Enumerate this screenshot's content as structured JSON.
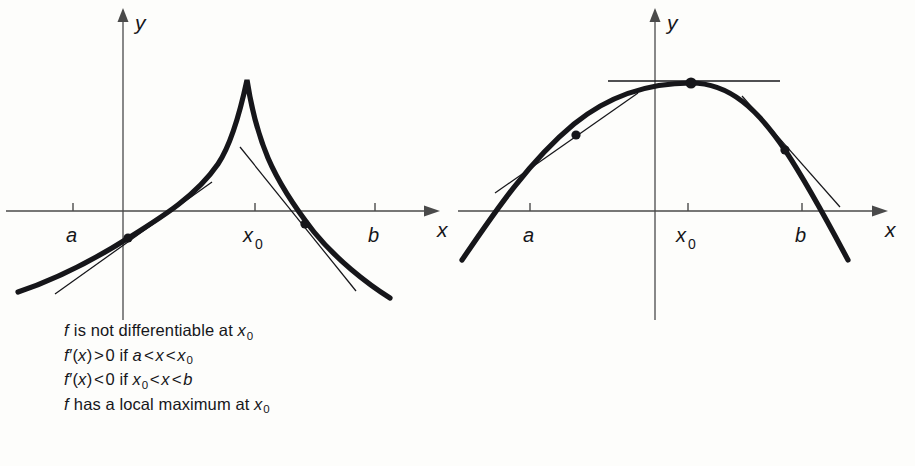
{
  "figure": {
    "background_color": "#fdfdfb",
    "ink_color": "#16161a",
    "axis_color": "#4a4a4a"
  },
  "panels": [
    {
      "id": "left",
      "curve_kind": "cusp",
      "axis_labels": {
        "x": "x",
        "y": "y"
      },
      "tick_labels": [
        {
          "name": "a",
          "text": "a",
          "x": 73
        },
        {
          "name": "x0",
          "text": "x",
          "sub": "0",
          "x": 255
        },
        {
          "name": "b",
          "text": "b",
          "x": 375
        }
      ],
      "caption_lines": [
        {
          "id": "line1",
          "segments": [
            {
              "t": "f",
              "style": "italic"
            },
            {
              "t": " is not differentiable at ",
              "style": "roman"
            },
            {
              "t": "x",
              "style": "italic"
            },
            {
              "t": "0",
              "style": "sub"
            }
          ]
        },
        {
          "id": "line2",
          "segments": [
            {
              "t": "f",
              "style": "italic"
            },
            {
              "t": "′(",
              "style": "roman"
            },
            {
              "t": "x",
              "style": "italic"
            },
            {
              "t": ")",
              "style": "roman"
            },
            {
              "t": ">",
              "style": "rel"
            },
            {
              "t": "0 if ",
              "style": "roman"
            },
            {
              "t": "a",
              "style": "italic"
            },
            {
              "t": "<",
              "style": "rel"
            },
            {
              "t": "x",
              "style": "italic"
            },
            {
              "t": "<",
              "style": "rel"
            },
            {
              "t": "x",
              "style": "italic"
            },
            {
              "t": "0",
              "style": "sub"
            }
          ]
        },
        {
          "id": "line3",
          "segments": [
            {
              "t": "f",
              "style": "italic"
            },
            {
              "t": "′(",
              "style": "roman"
            },
            {
              "t": "x",
              "style": "italic"
            },
            {
              "t": ")",
              "style": "roman"
            },
            {
              "t": "<",
              "style": "rel"
            },
            {
              "t": "0 if ",
              "style": "roman"
            },
            {
              "t": "x",
              "style": "italic"
            },
            {
              "t": "0",
              "style": "sub"
            },
            {
              "t": "<",
              "style": "rel"
            },
            {
              "t": "x",
              "style": "italic"
            },
            {
              "t": "<",
              "style": "rel"
            },
            {
              "t": "b",
              "style": "italic"
            }
          ]
        },
        {
          "id": "line4",
          "segments": [
            {
              "t": "f",
              "style": "italic"
            },
            {
              "t": " has a local maximum at ",
              "style": "roman"
            },
            {
              "t": "x",
              "style": "italic"
            },
            {
              "t": "0",
              "style": "sub"
            }
          ]
        }
      ]
    },
    {
      "id": "right",
      "curve_kind": "smooth-parabola",
      "axis_labels": {
        "x": "x",
        "y": "y"
      },
      "tick_labels": [
        {
          "name": "a",
          "text": "a",
          "x": 530
        },
        {
          "name": "x0",
          "text": "x",
          "sub": "0",
          "x": 688
        },
        {
          "name": "b",
          "text": "b",
          "x": 802
        }
      ],
      "caption_lines": [
        {
          "id": "line1",
          "segments": [
            {
              "t": "f",
              "style": "italic"
            },
            {
              "t": "′(",
              "style": "roman"
            },
            {
              "t": "x",
              "style": "italic"
            },
            {
              "t": "0",
              "style": "sub"
            },
            {
              "t": ") = 0",
              "style": "roman"
            }
          ]
        },
        {
          "id": "line2",
          "segments": [
            {
              "t": "f",
              "style": "italic"
            },
            {
              "t": "′(",
              "style": "roman"
            },
            {
              "t": "x",
              "style": "italic"
            },
            {
              "t": ")",
              "style": "roman"
            },
            {
              "t": ">",
              "style": "rel"
            },
            {
              "t": "0 if ",
              "style": "roman"
            },
            {
              "t": "a",
              "style": "italic"
            },
            {
              "t": "<",
              "style": "rel"
            },
            {
              "t": "x",
              "style": "italic"
            },
            {
              "t": "<",
              "style": "rel"
            },
            {
              "t": "x",
              "style": "italic"
            },
            {
              "t": "0",
              "style": "sub"
            }
          ]
        },
        {
          "id": "line3",
          "segments": [
            {
              "t": "f",
              "style": "italic"
            },
            {
              "t": "′(",
              "style": "roman"
            },
            {
              "t": "x",
              "style": "italic"
            },
            {
              "t": ")",
              "style": "roman"
            },
            {
              "t": "<",
              "style": "rel"
            },
            {
              "t": "0 if ",
              "style": "roman"
            },
            {
              "t": "x",
              "style": "italic"
            },
            {
              "t": "0",
              "style": "sub"
            },
            {
              "t": "<",
              "style": "rel"
            },
            {
              "t": "x",
              "style": "italic"
            },
            {
              "t": "<",
              "style": "rel"
            },
            {
              "t": "b",
              "style": "italic"
            }
          ]
        },
        {
          "id": "line4",
          "segments": [
            {
              "t": "f",
              "style": "italic"
            },
            {
              "t": " has a local maximum at ",
              "style": "roman"
            },
            {
              "t": "x",
              "style": "italic"
            },
            {
              "t": "0",
              "style": "sub"
            }
          ]
        }
      ]
    }
  ],
  "chart_data": [
    {
      "type": "line",
      "name": "left-cusp-graph",
      "title": "",
      "xlabel": "x",
      "ylabel": "y",
      "grid": false,
      "legend": "none",
      "description": "Curve rising from lower left to a sharp cusp at x0, then falling to lower right; not differentiable at x0.",
      "axes": {
        "x_axis_y": 211,
        "y_axis_x": 123,
        "x_axis_x_start": 6,
        "x_axis_x_end": 432,
        "y_axis_y_top": 12,
        "y_axis_y_bottom": 330
      },
      "ticks": [
        {
          "label": "a",
          "x": 73
        },
        {
          "label": "x0",
          "x": 255
        },
        {
          "label": "b",
          "x": 375
        }
      ],
      "curve_points": [
        [
          18,
          292
        ],
        [
          46,
          280
        ],
        [
          78,
          266
        ],
        [
          110,
          248
        ],
        [
          128,
          238
        ],
        [
          152,
          226
        ],
        [
          178,
          210
        ],
        [
          205,
          186
        ],
        [
          228,
          144
        ],
        [
          243,
          96
        ],
        [
          247,
          80
        ],
        [
          252,
          104
        ],
        [
          262,
          144
        ],
        [
          276,
          180
        ],
        [
          290,
          205
        ],
        [
          305,
          224
        ],
        [
          325,
          248
        ],
        [
          352,
          272
        ],
        [
          390,
          298
        ]
      ],
      "tangents": [
        {
          "name": "tangent-left",
          "at_point": [
            128,
            238
          ],
          "x1": 55,
          "y1": 294,
          "x2": 210,
          "y2": 183
        },
        {
          "name": "tangent-right",
          "at_point": [
            305,
            224
          ],
          "x1": 240,
          "y1": 148,
          "x2": 355,
          "y2": 290
        }
      ],
      "marked_points": [
        [
          128,
          238
        ],
        [
          305,
          224
        ]
      ]
    },
    {
      "type": "line",
      "name": "right-parabola-graph",
      "title": "",
      "xlabel": "x",
      "ylabel": "y",
      "grid": false,
      "legend": "none",
      "description": "Smooth concave-down curve with a horizontal tangent at its maximum at x0; derivative is zero there.",
      "axes": {
        "x_axis_y": 211,
        "y_axis_x": 655,
        "x_axis_x_start": 458,
        "x_axis_x_end": 890,
        "y_axis_y_top": 12,
        "y_axis_y_bottom": 330
      },
      "ticks": [
        {
          "label": "a",
          "x": 530
        },
        {
          "label": "x0",
          "x": 688
        },
        {
          "label": "b",
          "x": 802
        }
      ],
      "curve_points": [
        [
          462,
          260
        ],
        [
          486,
          228
        ],
        [
          512,
          196
        ],
        [
          540,
          166
        ],
        [
          576,
          135
        ],
        [
          612,
          112
        ],
        [
          650,
          93
        ],
        [
          691,
          83
        ],
        [
          724,
          88
        ],
        [
          752,
          102
        ],
        [
          785,
          150
        ],
        [
          806,
          186
        ],
        [
          828,
          228
        ],
        [
          848,
          260
        ]
      ],
      "tangents": [
        {
          "name": "tangent-horizontal-at-max",
          "at_point": [
            691,
            83
          ],
          "x1": 608,
          "y1": 81,
          "x2": 780,
          "y2": 81
        },
        {
          "name": "tangent-left-positive",
          "at_point": [
            576,
            135
          ],
          "x1": 495,
          "y1": 193,
          "x2": 637,
          "y2": 94
        },
        {
          "name": "tangent-right-negative",
          "at_point": [
            785,
            150
          ],
          "x1": 742,
          "y1": 96,
          "x2": 840,
          "y2": 206
        }
      ],
      "marked_points": [
        [
          576,
          135
        ],
        [
          691,
          83
        ],
        [
          785,
          150
        ]
      ]
    }
  ]
}
